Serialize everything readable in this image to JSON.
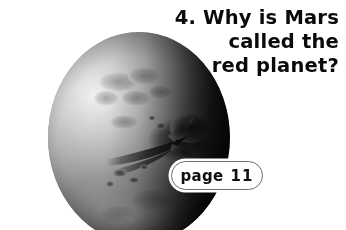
{
  "page": {
    "background_color": "#ffffff",
    "width": 346,
    "height": 230
  },
  "question": {
    "number": "4.",
    "lines": [
      "4. Why is Mars",
      "called the",
      "red planet?"
    ],
    "full_text": "4. Why is Mars called the red planet?",
    "text_color": "#0a0a0a",
    "alignment": "right"
  },
  "page_reference": {
    "label": "page",
    "number": "11",
    "full_text": "page 11",
    "shape": "pill",
    "fill_color": "#ffffff",
    "border_color": "#6d6d6d"
  },
  "illustration": {
    "name": "mars-planet-photo",
    "subject": "Mars",
    "style": "grayscale photograph",
    "lighting": "lit from upper-left, dark terminator on right limb",
    "features": [
      "valles-marineris-canyon-streak",
      "dark-albedo-region-right",
      "south-polar-bright-patch",
      "mottled-crater-markings"
    ],
    "highlight_color": "#f2f2f2",
    "shadow_color": "#050505"
  }
}
